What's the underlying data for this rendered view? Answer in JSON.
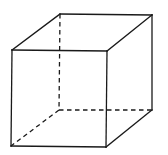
{
  "diagram": {
    "type": "wireframe-cube",
    "colors": {
      "background": "#ffffff",
      "stroke": "#1a1a1a"
    },
    "vertices": {
      "front_top_left": [
        12,
        50
      ],
      "front_top_right": [
        107,
        51
      ],
      "front_bottom_right": [
        106,
        147
      ],
      "front_bottom_left": [
        11,
        146
      ],
      "back_top_left": [
        60,
        14
      ],
      "back_top_right": [
        152,
        15
      ],
      "back_bottom_right": [
        152,
        110
      ],
      "back_bottom_left": [
        59,
        110
      ]
    },
    "edges": [
      {
        "name": "front-top-edge",
        "from": "front_top_left",
        "to": "front_top_right",
        "style": "solid"
      },
      {
        "name": "front-right-edge",
        "from": "front_top_right",
        "to": "front_bottom_right",
        "style": "solid"
      },
      {
        "name": "front-bottom-edge",
        "from": "front_bottom_right",
        "to": "front_bottom_left",
        "style": "solid"
      },
      {
        "name": "front-left-edge",
        "from": "front_bottom_left",
        "to": "front_top_left",
        "style": "solid"
      },
      {
        "name": "back-top-edge",
        "from": "back_top_left",
        "to": "back_top_right",
        "style": "solid"
      },
      {
        "name": "back-right-edge",
        "from": "back_top_right",
        "to": "back_bottom_right",
        "style": "solid"
      },
      {
        "name": "top-left-depth-edge",
        "from": "front_top_left",
        "to": "back_top_left",
        "style": "solid"
      },
      {
        "name": "top-right-depth-edge",
        "from": "front_top_right",
        "to": "back_top_right",
        "style": "solid"
      },
      {
        "name": "bottom-right-depth-edge",
        "from": "front_bottom_right",
        "to": "back_bottom_right",
        "style": "solid"
      },
      {
        "name": "back-left-hidden-edge",
        "from": "back_top_left",
        "to": "back_bottom_left",
        "style": "dashed"
      },
      {
        "name": "back-bottom-hidden-edge",
        "from": "back_bottom_left",
        "to": "back_bottom_right",
        "style": "dashed"
      },
      {
        "name": "bottom-left-depth-hidden-edge",
        "from": "back_bottom_left",
        "to": "front_bottom_left",
        "style": "dashed"
      }
    ]
  }
}
